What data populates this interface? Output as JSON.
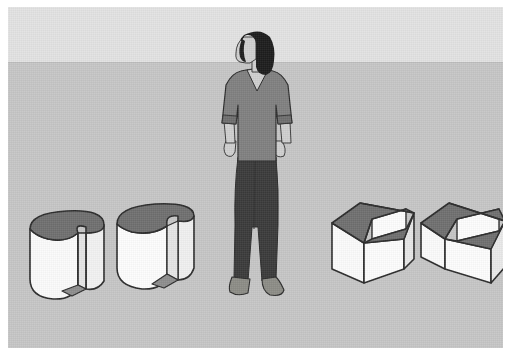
{
  "image": {
    "title": "Spatial reasoning scene: woman standing among four notched 3D solids",
    "alt": "Line-art illustration of a standing woman with two slotted cylinders to her left and two step-notched cubes to her right on a plain gray ground plane"
  },
  "palette": {
    "page_background": "#ffffff",
    "sky": "#e2e2e2",
    "ground": "#c6c6c6",
    "horizon_line": "#bdbdbd",
    "solid_light_face": "#fbfbfb",
    "solid_mid_face": "#ececec",
    "solid_shadow_face": "#d9d9d9",
    "solid_top_face": "#6f6f6f",
    "solid_outline": "#2b2b2b",
    "hair": "#1c1c1c",
    "skin": "#cfcfcf",
    "sweater": "#808080",
    "sweater_shade": "#6e6e6e",
    "pants": "#3a3a3a",
    "shoes": "#8c8c86"
  },
  "scene": {
    "background": {
      "name": "studio-backdrop",
      "sky_label": "upper wall",
      "ground_label": "floor plane",
      "horizon_y": 55
    },
    "figure": {
      "name": "standing-woman",
      "label": "Standing woman, left profile",
      "facing": "left",
      "parts": [
        {
          "name": "hair",
          "label": "Dark shoulder-length hair"
        },
        {
          "name": "face",
          "label": "Face in left profile"
        },
        {
          "name": "sweater",
          "label": "Gray V-neck sweater with pushed-up sleeves"
        },
        {
          "name": "left-arm",
          "label": "Left arm hanging at side"
        },
        {
          "name": "right-arm",
          "label": "Right arm hanging at side"
        },
        {
          "name": "pants",
          "label": "Dark bootcut trousers"
        },
        {
          "name": "left-shoe",
          "label": "Gray shoe"
        },
        {
          "name": "right-shoe",
          "label": "Gray shoe"
        }
      ]
    },
    "objects": [
      {
        "id": "cylinder-1",
        "name": "slotted-cylinder-left",
        "label": "Cylinder with vertical slot cut through the front",
        "shape": "cylinder",
        "feature": "rectangular through-slot",
        "position": "far left, nearest viewer",
        "top_face_tone": "dark",
        "order": 1
      },
      {
        "id": "cylinder-2",
        "name": "slotted-cylinder-right",
        "label": "Cylinder with vertical slot, rotated",
        "shape": "cylinder",
        "feature": "rectangular through-slot",
        "position": "left of centre",
        "top_face_tone": "dark",
        "order": 2
      },
      {
        "id": "cube-1",
        "name": "notched-cube-left",
        "label": "Cube with step notch cut from the top-front corner",
        "shape": "cube",
        "feature": "L-shaped step notch",
        "position": "right of centre",
        "top_face_tone": "dark",
        "order": 3
      },
      {
        "id": "cube-2",
        "name": "notched-cube-right",
        "label": "Cube with step notch, mirrored orientation",
        "shape": "cube",
        "feature": "L-shaped step notch",
        "position": "far right",
        "top_face_tone": "dark",
        "order": 4
      }
    ],
    "counts": {
      "people": 1,
      "cylinders": 2,
      "cubes": 2,
      "objects_total": 4
    }
  }
}
